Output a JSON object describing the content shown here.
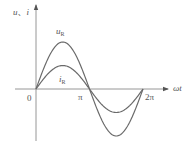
{
  "diagram": {
    "type": "sine-waveform",
    "line_color": "#6a6a6a",
    "axis_color": "#8a8a8a",
    "text_color": "#555555",
    "y_axis_label": {
      "main": "u",
      "sep": "、",
      "second": "i"
    },
    "x_axis_label": "ωt",
    "origin_label": "0",
    "ticks": [
      {
        "label": "π",
        "value": 3.14159
      },
      {
        "label": "2π",
        "value": 6.28318
      }
    ],
    "curves": [
      {
        "name": "u",
        "subscript": "R",
        "relative_amplitude": 2.0
      },
      {
        "name": "i",
        "subscript": "R",
        "relative_amplitude": 1.0
      }
    ]
  },
  "chart_data": {
    "type": "line",
    "title": "",
    "xlabel": "ωt",
    "ylabel": "u、i",
    "x_ticks": [
      "0",
      "π",
      "2π"
    ],
    "xlim": [
      0,
      6.2832
    ],
    "grid": false,
    "legend": "inline labels",
    "series": [
      {
        "name": "u_R",
        "function": "2·sin(ωt)",
        "x": [
          0,
          1.5708,
          3.1416,
          4.7124,
          6.2832
        ],
        "values": [
          0,
          2,
          0,
          -2,
          0
        ]
      },
      {
        "name": "i_R",
        "function": "sin(ωt)",
        "x": [
          0,
          1.5708,
          3.1416,
          4.7124,
          6.2832
        ],
        "values": [
          0,
          1,
          0,
          -1,
          0
        ]
      }
    ]
  }
}
